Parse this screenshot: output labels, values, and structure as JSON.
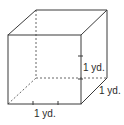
{
  "figure": {
    "type": "cube",
    "line_color": "#3a3a3a",
    "dashed_color": "#555555",
    "labels": {
      "height": "1 yd.",
      "depth": "1 yd.",
      "width": "1 yd."
    }
  }
}
